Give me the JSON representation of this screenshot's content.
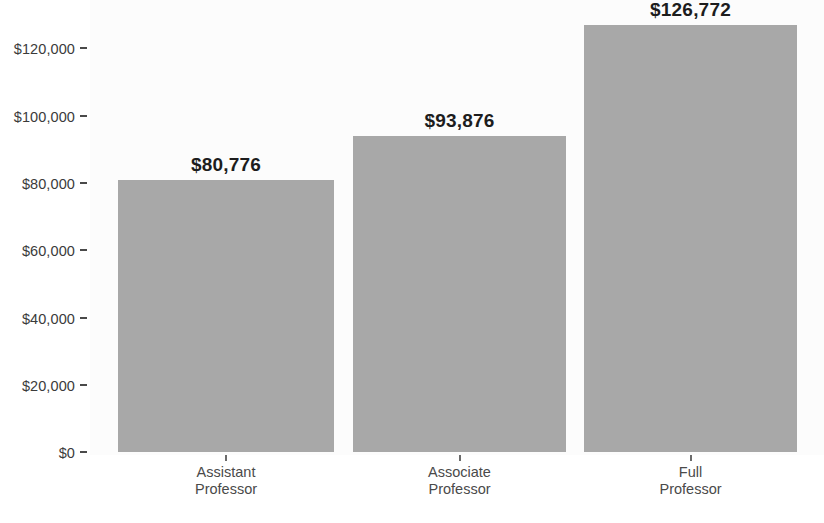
{
  "chart_data": {
    "type": "bar",
    "title": "",
    "subtitle": "",
    "xlabel": "",
    "ylabel": "",
    "categories": [
      "Assistant\nProfessor",
      "Associate\nProfessor",
      "Full\nProfessor"
    ],
    "category_lines": [
      [
        "Assistant",
        "Professor"
      ],
      [
        "Associate",
        "Professor"
      ],
      [
        "Full",
        "Professor"
      ]
    ],
    "values": [
      80776,
      93876,
      126772
    ],
    "value_labels": [
      "$80,776",
      "$93,876",
      "$126,772"
    ],
    "ylim": [
      0,
      135000
    ],
    "y_ticks": [
      0,
      20000,
      40000,
      60000,
      80000,
      100000,
      120000
    ],
    "y_tick_labels": [
      "$0",
      "$20,000",
      "$40,000",
      "$60,000",
      "$80,000",
      "$100,000",
      "$120,000"
    ],
    "grid": false,
    "legend": null,
    "legend_position": "none",
    "bar_color": "#a8a8a8",
    "panel_background": "#fcfcfc",
    "label_color": "#1d1d1d",
    "axis_text_color": "#4a4a4a"
  }
}
